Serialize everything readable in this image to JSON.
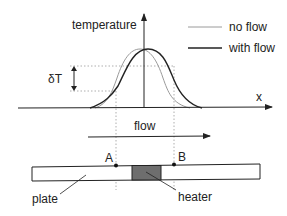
{
  "diagram": {
    "y_axis_label": "temperature",
    "x_axis_label": "x",
    "delta_label": "δT",
    "legend": [
      {
        "label": "no flow",
        "color": "#9a9a9a"
      },
      {
        "label": "with flow",
        "color": "#222222"
      }
    ],
    "flow_label": "flow",
    "point_a_label": "A",
    "point_b_label": "B",
    "plate_label": "plate",
    "heater_label": "heater",
    "colors": {
      "line": "#222222",
      "no_flow_curve": "#9a9a9a",
      "with_flow_curve": "#222222",
      "heater_fill": "#6e6e6e",
      "dotted": "#9a9a9a"
    }
  }
}
